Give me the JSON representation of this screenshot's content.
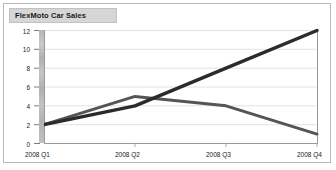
{
  "chart_data": {
    "type": "line",
    "title": "FlexMoto Car Sales",
    "xlabel": "",
    "ylabel": "",
    "categories": [
      "2008 Q1",
      "2008 Q2",
      "2008 Q3",
      "2008 Q4"
    ],
    "series": [
      {
        "name": "series-1",
        "values": [
          2,
          4,
          8,
          12
        ],
        "color": "#2b2b2b"
      },
      {
        "name": "series-2",
        "values": [
          2,
          5,
          4,
          1
        ],
        "color": "#555555"
      }
    ],
    "yticks": [
      0,
      2,
      4,
      6,
      8,
      10,
      12
    ],
    "ylim": [
      0,
      12
    ],
    "grid": true,
    "legend": "none"
  },
  "axis": {
    "y_labels": [
      "12",
      "10",
      "8",
      "6",
      "4",
      "2",
      "0"
    ],
    "x_labels": [
      "2008 Q1",
      "2008 Q2",
      "2008 Q3",
      "2008 Q4"
    ]
  },
  "colors": {
    "frame_border": "#b9b9b9",
    "title_band": "#d6d6d6",
    "gridline": "#e3e3e3",
    "axis_line": "#9a9a9a",
    "text": "#1a1a1a"
  }
}
